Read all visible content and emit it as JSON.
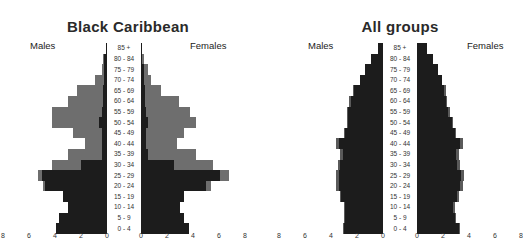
{
  "colors": {
    "dark": "#1c1c1c",
    "grey_bc": "#6e6e6e",
    "grey_all": "#5a5a5a",
    "background": "#ffffff"
  },
  "chart_data": [
    {
      "type": "bar",
      "subtype": "population-pyramid",
      "title": "Black Caribbean",
      "left_label": "Males",
      "right_label": "Females",
      "categories": [
        "85 +",
        "80 - 84",
        "75 - 79",
        "70 - 74",
        "65 - 69",
        "60 - 64",
        "55 - 59",
        "50 - 54",
        "45 - 49",
        "40 - 44",
        "35 - 39",
        "30 - 34",
        "25 - 29",
        "20 - 24",
        "15 - 19",
        "10 - 14",
        "5 - 9",
        "0 - 4"
      ],
      "xlabel": "",
      "ylabel": "",
      "x_ticks_left": [
        "8",
        "6",
        "4",
        "2",
        "0"
      ],
      "x_ticks_right": [
        "0",
        "2",
        "4",
        "6",
        "8"
      ],
      "xlim": [
        0,
        8
      ],
      "grid": false,
      "series": [
        {
          "name": "Males (dark)",
          "values": [
            0.1,
            0.2,
            0.2,
            0.2,
            0.3,
            0.3,
            0.4,
            0.6,
            0.4,
            0.4,
            0.4,
            2.0,
            5.0,
            4.8,
            3.4,
            3.0,
            3.7,
            3.9
          ]
        },
        {
          "name": "Males (total)",
          "values": [
            0.1,
            0.3,
            0.4,
            0.9,
            2.3,
            3.0,
            4.2,
            4.2,
            2.6,
            1.7,
            3.0,
            4.2,
            5.3,
            4.9,
            3.4,
            3.0,
            3.7,
            3.9
          ]
        },
        {
          "name": "Females (dark)",
          "values": [
            0.1,
            0.1,
            0.2,
            0.2,
            0.3,
            0.3,
            0.4,
            0.5,
            0.4,
            0.4,
            0.5,
            2.5,
            6.1,
            5.0,
            3.3,
            3.0,
            3.3,
            3.7
          ]
        },
        {
          "name": "Females (total)",
          "values": [
            0.1,
            0.2,
            0.5,
            0.8,
            1.5,
            2.9,
            3.8,
            4.2,
            3.3,
            2.8,
            4.2,
            5.5,
            6.8,
            5.4,
            3.3,
            3.0,
            3.3,
            3.7
          ]
        }
      ]
    },
    {
      "type": "bar",
      "subtype": "population-pyramid",
      "title": "All groups",
      "left_label": "Males",
      "right_label": "Females",
      "categories": [
        "85 +",
        "80 - 84",
        "75 - 79",
        "70 - 74",
        "65 - 69",
        "60 - 64",
        "55 - 59",
        "50 - 54",
        "45 - 49",
        "40 - 44",
        "35 - 39",
        "30 - 34",
        "25 - 29",
        "20 - 24",
        "15 - 19",
        "10 - 14",
        "5 - 9",
        "0 - 4"
      ],
      "xlabel": "",
      "ylabel": "",
      "x_ticks_left": [
        "8",
        "6",
        "4",
        "2",
        "0"
      ],
      "x_ticks_right": [
        "0",
        "2",
        "4",
        "6",
        "8"
      ],
      "xlim": [
        0,
        8
      ],
      "grid": false,
      "series": [
        {
          "name": "Males (dark)",
          "values": [
            0.4,
            0.9,
            1.4,
            1.8,
            2.2,
            2.5,
            2.7,
            2.7,
            2.9,
            3.4,
            3.1,
            3.3,
            3.4,
            3.4,
            3.2,
            2.9,
            2.9,
            3.0
          ]
        },
        {
          "name": "Males (total)",
          "values": [
            0.4,
            0.9,
            1.4,
            1.8,
            2.3,
            2.6,
            2.8,
            2.8,
            3.0,
            3.6,
            3.3,
            3.5,
            3.6,
            3.6,
            3.3,
            3.0,
            3.0,
            3.1
          ]
        },
        {
          "name": "Females (dark)",
          "values": [
            0.8,
            1.2,
            1.6,
            1.9,
            2.1,
            2.2,
            2.4,
            2.7,
            2.9,
            3.3,
            3.0,
            3.1,
            3.4,
            3.3,
            3.1,
            2.8,
            2.9,
            3.2
          ]
        },
        {
          "name": "Females (total)",
          "values": [
            0.8,
            1.2,
            1.6,
            1.9,
            2.2,
            2.3,
            2.5,
            2.8,
            3.0,
            3.5,
            3.2,
            3.3,
            3.6,
            3.5,
            3.2,
            2.9,
            3.0,
            3.3
          ]
        }
      ]
    }
  ],
  "layout": {
    "panels": [
      {
        "male_zero_x": 107,
        "female_zero_x": 141,
        "px_per_unit": 13,
        "center_x": 124,
        "grey_key": "grey_bc"
      },
      {
        "male_zero_x": 383,
        "female_zero_x": 417,
        "px_per_unit": 13,
        "center_x": 400,
        "grey_key": "grey_all"
      }
    ],
    "row_top": 43,
    "row_height": 10.6
  }
}
